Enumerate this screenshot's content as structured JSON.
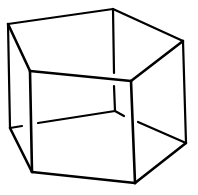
{
  "figure": {
    "stroke_color": "#000000",
    "background_color": "#ffffff",
    "vertices": {
      "top_left": [
        8,
        24
      ],
      "top_back": [
        113,
        9
      ],
      "top_right": [
        183,
        41
      ],
      "top_front_right": [
        131,
        81
      ],
      "top_front_left": [
        30,
        71
      ],
      "bottom_left": [
        10,
        128
      ],
      "bottom_back": [
        115,
        111
      ],
      "bottom_right": [
        186,
        143
      ],
      "bottom_front_right": [
        135,
        183
      ],
      "bottom_front_left": [
        32,
        172
      ]
    }
  }
}
